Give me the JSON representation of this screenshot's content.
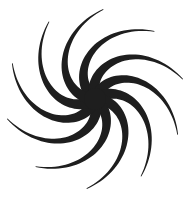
{
  "graphic": {
    "type": "spiral-swirl",
    "arm_count": 10,
    "center": [
      95,
      99
    ],
    "arm_color": "#1e1e1e",
    "background": "#ffffff",
    "core_radius": 11
  }
}
